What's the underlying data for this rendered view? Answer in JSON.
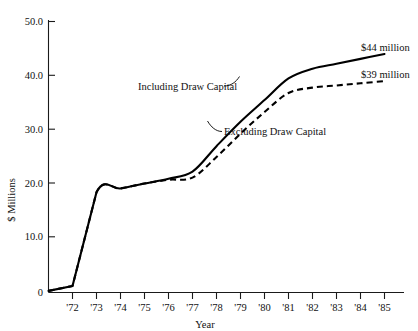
{
  "chart_data": {
    "type": "line",
    "title": "",
    "xlabel": "Year",
    "ylabel": "$ Millions",
    "grid": false,
    "legend_position": "inline-annotations",
    "x": [
      1971,
      1972,
      1973,
      1974,
      1975,
      1976,
      1977,
      1978,
      1979,
      1980,
      1981,
      1982,
      1983,
      1984,
      1985
    ],
    "xtick_labels": [
      "'72",
      "'73",
      "'74",
      "'75",
      "'76",
      "'77",
      "'78",
      "'79",
      "'80",
      "'81",
      "'82",
      "'83",
      "'84",
      "'85"
    ],
    "ytick_labels": [
      "0",
      "10.0",
      "20.0",
      "30.0",
      "40.0",
      "50.0"
    ],
    "ytick_values": [
      0,
      10,
      20,
      30,
      40,
      50
    ],
    "xlim": [
      1971,
      1985.6
    ],
    "ylim": [
      0,
      50
    ],
    "series": [
      {
        "name": "Including Draw Capital",
        "style": "solid",
        "end_label": "$44 million",
        "values": [
          0.3,
          1.2,
          18.5,
          19.2,
          20.1,
          21.0,
          22.3,
          27.0,
          31.5,
          35.5,
          39.5,
          41.3,
          42.2,
          43.1,
          44.0
        ]
      },
      {
        "name": "Excluding Draw Capital",
        "style": "dashed",
        "end_label": "$39 million",
        "values": [
          0.3,
          1.2,
          18.5,
          19.2,
          20.1,
          20.8,
          21.2,
          25.0,
          29.3,
          33.3,
          36.8,
          37.8,
          38.2,
          38.6,
          39.0
        ]
      }
    ],
    "annotations": [
      {
        "text": "Including Draw Capital",
        "series": "Including Draw Capital"
      },
      {
        "text": "Excluding Draw Capital",
        "series": "Excluding Draw Capital"
      }
    ]
  },
  "axes": {
    "y_title": "$ Millions",
    "x_title": "Year",
    "y_ticks": [
      "50.0",
      "40.0",
      "30.0",
      "20.0",
      "10.0",
      "0"
    ],
    "x_ticks": [
      "'72",
      "'73",
      "'74",
      "'75",
      "'76",
      "'77",
      "'78",
      "'79",
      "'80",
      "'81",
      "'82",
      "'83",
      "'84",
      "'85"
    ]
  },
  "annotations": {
    "including": "Including Draw Capital",
    "excluding": "Excluding Draw Capital"
  },
  "end_labels": {
    "solid": "$44 million",
    "dashed": "$39 million"
  },
  "colors": {
    "line": "#000000",
    "axis": "#1a1a1a",
    "background": "#ffffff"
  }
}
